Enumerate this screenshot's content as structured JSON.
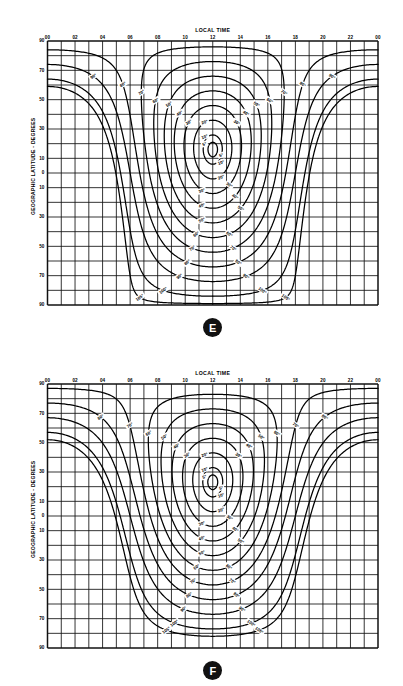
{
  "figure": {
    "panels": [
      {
        "id": "E",
        "badge_label": "E",
        "title": "LOCAL TIME",
        "ylabel": "GEOGRAPHIC LATITUDE - DEGREES",
        "subsolar_latitude_deg": 16,
        "chart_data": {
          "type": "line",
          "title": "LOCAL TIME",
          "xlabel": "LOCAL TIME",
          "ylabel": "GEOGRAPHIC LATITUDE - DEGREES",
          "xlim": [
            0,
            24
          ],
          "ylim": [
            -90,
            90
          ],
          "grid": true,
          "grid_x_step": 1,
          "grid_y_step": 10,
          "legend": "none",
          "xticks": [
            "00",
            "02",
            "04",
            "06",
            "08",
            "10",
            "12",
            "14",
            "16",
            "18",
            "20",
            "22",
            "00"
          ],
          "xtick_values": [
            0,
            2,
            4,
            6,
            8,
            10,
            12,
            14,
            16,
            18,
            20,
            22,
            24
          ],
          "yticks": [
            "90",
            "70",
            "50",
            "30",
            "10",
            "0",
            "10",
            "30",
            "50",
            "70",
            "90"
          ],
          "ytick_values": [
            90,
            70,
            50,
            30,
            10,
            0,
            -10,
            -30,
            -50,
            -70,
            -90
          ],
          "contour_quantity": "solar zenith angle",
          "contour_unit": "degrees",
          "contour_levels": [
            5,
            10,
            20,
            30,
            40,
            50,
            60,
            70,
            80,
            90,
            100,
            105
          ],
          "contour_labels": [
            "5°",
            "10°",
            "20°",
            "30°",
            "40°",
            "50°",
            "60°",
            "70°",
            "80°",
            "90°",
            "100°",
            "105°"
          ],
          "subsolar_point": {
            "local_time": 12,
            "latitude": 16
          },
          "description": "Contours of constant solar zenith angle as a function of local time and geographic latitude."
        }
      },
      {
        "id": "F",
        "badge_label": "F",
        "title": "LOCAL TIME",
        "ylabel": "GEOGRAPHIC LATITUDE - DEGREES",
        "subsolar_latitude_deg": 23,
        "chart_data": {
          "type": "line",
          "title": "LOCAL TIME",
          "xlabel": "LOCAL TIME",
          "ylabel": "GEOGRAPHIC LATITUDE - DEGREES",
          "xlim": [
            0,
            24
          ],
          "ylim": [
            -90,
            90
          ],
          "grid": true,
          "grid_x_step": 1,
          "grid_y_step": 10,
          "legend": "none",
          "xticks": [
            "00",
            "02",
            "04",
            "06",
            "08",
            "10",
            "12",
            "14",
            "16",
            "18",
            "20",
            "22",
            "00"
          ],
          "xtick_values": [
            0,
            2,
            4,
            6,
            8,
            10,
            12,
            14,
            16,
            18,
            20,
            22,
            24
          ],
          "yticks": [
            "90",
            "70",
            "50",
            "30",
            "10",
            "0",
            "10",
            "30",
            "50",
            "70",
            "90"
          ],
          "ytick_values": [
            90,
            70,
            50,
            30,
            10,
            0,
            -10,
            -30,
            -50,
            -70,
            -90
          ],
          "contour_quantity": "solar zenith angle",
          "contour_unit": "degrees",
          "contour_levels": [
            5,
            10,
            20,
            30,
            40,
            50,
            60,
            70,
            80,
            90,
            100,
            105
          ],
          "contour_labels": [
            "5°",
            "10°",
            "20°",
            "30°",
            "40°",
            "50°",
            "60°",
            "70°",
            "80°",
            "90°",
            "100°",
            "105°"
          ],
          "subsolar_point": {
            "local_time": 12,
            "latitude": 23
          },
          "description": "Contours of constant solar zenith angle as a function of local time and geographic latitude."
        }
      }
    ]
  }
}
